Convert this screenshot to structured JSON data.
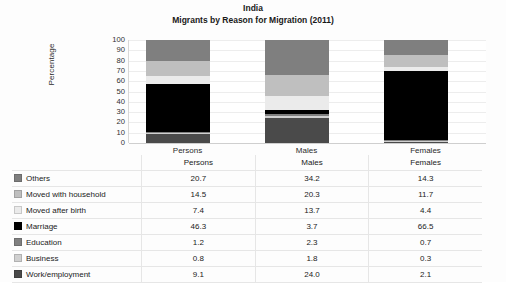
{
  "chart_data": {
    "type": "bar",
    "subtype": "stacked-percentage-column",
    "title": "India",
    "subtitle": "Migrants by Reason for Migration (2011)",
    "xlabel": "",
    "ylabel": "Percentage",
    "ylim": [
      0,
      100
    ],
    "yticks": [
      100,
      90,
      80,
      70,
      60,
      50,
      40,
      30,
      20,
      10,
      0
    ],
    "grid": true,
    "legend_position": "table-below",
    "categories": [
      "Persons",
      "Males",
      "Females"
    ],
    "series": [
      {
        "name": "Others",
        "values": [
          20.7,
          34.2,
          14.3
        ],
        "color": "#7f7f7f"
      },
      {
        "name": "Moved with household",
        "values": [
          14.5,
          20.3,
          11.7
        ],
        "color": "#bfbfbf"
      },
      {
        "name": "Moved after birth",
        "values": [
          7.4,
          13.7,
          4.4
        ],
        "color": "#ebebeb"
      },
      {
        "name": "Marriage",
        "values": [
          46.3,
          3.7,
          66.5
        ],
        "color": "#000000"
      },
      {
        "name": "Education",
        "values": [
          1.2,
          2.3,
          0.7
        ],
        "color": "#808080"
      },
      {
        "name": "Business",
        "values": [
          0.8,
          1.8,
          0.3
        ],
        "color": "#d0d0d0"
      },
      {
        "name": "Work/employment",
        "values": [
          9.1,
          24.0,
          2.1
        ],
        "color": "#4a4a4a"
      }
    ],
    "stack_order_bottom_to_top": [
      "Work/employment",
      "Business",
      "Education",
      "Marriage",
      "Moved after birth",
      "Moved with household",
      "Others"
    ]
  },
  "table": {
    "header": {
      "name_col": "",
      "columns": [
        "Persons",
        "Males",
        "Females"
      ]
    },
    "rows": [
      {
        "label": "Others",
        "swatch": "#7f7f7f",
        "values": [
          "20.7",
          "34.2",
          "14.3"
        ]
      },
      {
        "label": "Moved with household",
        "swatch": "#bfbfbf",
        "values": [
          "14.5",
          "20.3",
          "11.7"
        ]
      },
      {
        "label": "Moved after birth",
        "swatch": "#ebebeb",
        "values": [
          "7.4",
          "13.7",
          "4.4"
        ]
      },
      {
        "label": "Marriage",
        "swatch": "#000000",
        "values": [
          "46.3",
          "3.7",
          "66.5"
        ]
      },
      {
        "label": "Education",
        "swatch": "#808080",
        "values": [
          "1.2",
          "2.3",
          "0.7"
        ]
      },
      {
        "label": "Business",
        "swatch": "#d0d0d0",
        "values": [
          "0.8",
          "1.8",
          "0.3"
        ]
      },
      {
        "label": "Work/employment",
        "swatch": "#4a4a4a",
        "values": [
          "9.1",
          "24.0",
          "2.1"
        ]
      }
    ]
  }
}
